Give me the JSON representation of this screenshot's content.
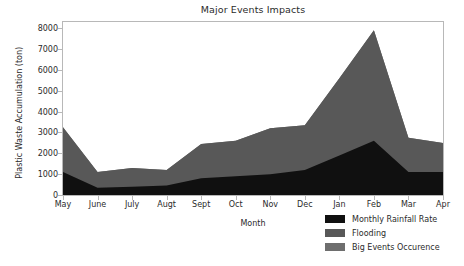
{
  "chart_data": {
    "type": "area",
    "stacked": true,
    "title": "Major Events Impacts",
    "xlabel": "Month",
    "ylabel": "Plastic Waste Accumulation (ton)",
    "categories": [
      "May",
      "June",
      "July",
      "Augt",
      "Sept",
      "Oct",
      "Nov",
      "Dec",
      "Jan",
      "Feb",
      "Mar",
      "Apr"
    ],
    "series": [
      {
        "name": "Monthly Rainfall Rate",
        "color": "#101010",
        "values": [
          1100,
          350,
          400,
          450,
          800,
          900,
          1000,
          1200,
          1900,
          2600,
          1100,
          1100
        ]
      },
      {
        "name": "Flooding",
        "color": "#585858",
        "values": [
          2150,
          750,
          900,
          750,
          1650,
          1700,
          2200,
          2150,
          3700,
          5300,
          1650,
          1400
        ]
      },
      {
        "name": "Big Events Occurence",
        "color": "#6e6e6e",
        "values": [
          0,
          0,
          0,
          0,
          0,
          0,
          0,
          0,
          0,
          0,
          0,
          0
        ]
      }
    ],
    "cumulative_tops": [
      3250,
      1100,
      1300,
      1200,
      2450,
      2600,
      3200,
      3350,
      5600,
      7900,
      2750,
      2500
    ],
    "ylim": [
      0,
      8300
    ],
    "yticks": [
      0,
      1000,
      2000,
      3000,
      4000,
      5000,
      6000,
      7000,
      8000
    ],
    "ytick_labels": [
      "0",
      "1000",
      "2000",
      "3000",
      "4000",
      "5000",
      "6000",
      "7000",
      "8000"
    ],
    "grid": false,
    "legend_position": "lower right"
  },
  "legend": {
    "items": [
      {
        "label": "Monthly Rainfall Rate",
        "color": "#101010"
      },
      {
        "label": "Flooding",
        "color": "#585858"
      },
      {
        "label": "Big Events Occurence",
        "color": "#6e6e6e"
      }
    ]
  }
}
